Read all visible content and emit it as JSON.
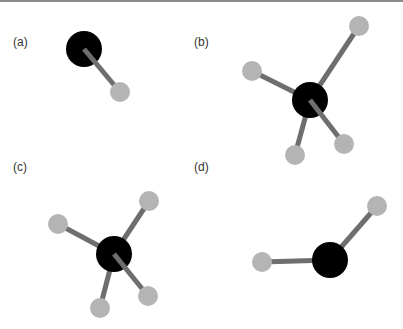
{
  "figure": {
    "colors": {
      "central_atom": "#000000",
      "peripheral_atom": "#b4b4b4",
      "bond": "#6e6e6e",
      "rule": "#8a8a8a"
    },
    "panels": [
      {
        "label": "(a)",
        "label_pos": [
          13,
          35
        ],
        "central": {
          "x": 84,
          "y": 49,
          "r": 18
        },
        "peripherals": [
          {
            "x": 120,
            "y": 92,
            "r": 10
          }
        ]
      },
      {
        "label": "(b)",
        "label_pos": [
          194,
          35
        ],
        "central": {
          "x": 310,
          "y": 100,
          "r": 18
        },
        "peripherals": [
          {
            "x": 359,
            "y": 26,
            "r": 10
          },
          {
            "x": 252,
            "y": 71,
            "r": 10
          },
          {
            "x": 295,
            "y": 155,
            "r": 10
          },
          {
            "x": 344,
            "y": 144,
            "r": 10
          }
        ]
      },
      {
        "label": "(c)",
        "label_pos": [
          13,
          160
        ],
        "central": {
          "x": 114,
          "y": 254,
          "r": 18
        },
        "peripherals": [
          {
            "x": 149,
            "y": 201,
            "r": 10
          },
          {
            "x": 58,
            "y": 224,
            "r": 10
          },
          {
            "x": 100,
            "y": 308,
            "r": 10
          },
          {
            "x": 148,
            "y": 296,
            "r": 10
          }
        ]
      },
      {
        "label": "(d)",
        "label_pos": [
          194,
          160
        ],
        "central": {
          "x": 330,
          "y": 260,
          "r": 18
        },
        "peripherals": [
          {
            "x": 377,
            "y": 206,
            "r": 10
          },
          {
            "x": 262,
            "y": 262,
            "r": 10
          }
        ]
      }
    ]
  }
}
